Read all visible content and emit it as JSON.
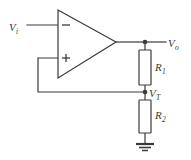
{
  "diagram": {
    "type": "circuit-schematic",
    "stroke_color": "#3a3a3a",
    "fill_color": "#ffffff",
    "background": "#ffffff",
    "labels": {
      "input": {
        "symbol": "V",
        "subscript": "i"
      },
      "output": {
        "symbol": "V",
        "subscript": "o"
      },
      "threshold": {
        "symbol": "V",
        "subscript": "T"
      },
      "resistor1": {
        "symbol": "R",
        "subscript": "1"
      },
      "resistor2": {
        "symbol": "R",
        "subscript": "2"
      }
    },
    "terminals": {
      "inverting": "−",
      "noninverting": "+"
    },
    "components": [
      {
        "name": "op-amp",
        "kind": "triangle-amplifier"
      },
      {
        "name": "resistor-r1",
        "kind": "resistor-box"
      },
      {
        "name": "resistor-r2",
        "kind": "resistor-box"
      },
      {
        "name": "ground",
        "kind": "earth-ground"
      }
    ],
    "nodes": [
      {
        "name": "output-node",
        "label": "V_o"
      },
      {
        "name": "threshold-node",
        "label": "V_T"
      }
    ]
  }
}
